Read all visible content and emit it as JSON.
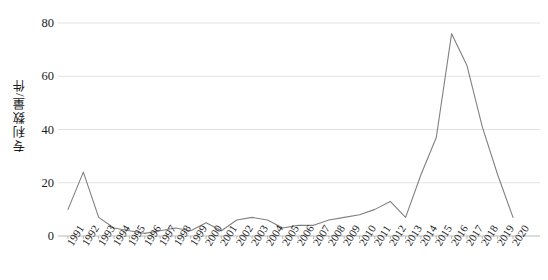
{
  "chart_data": {
    "type": "line",
    "title": "",
    "subtitle": "",
    "xlabel": "",
    "ylabel": "专利数量/件",
    "ylim": [
      0,
      80
    ],
    "yticks": [
      0,
      20,
      40,
      60,
      80
    ],
    "grid": true,
    "legend": "none",
    "line_color": "#808080",
    "categories": [
      "1991",
      "1992",
      "1993",
      "1994",
      "1995",
      "1996",
      "1997",
      "1998",
      "1999",
      "2000",
      "2001",
      "2002",
      "2003",
      "2004",
      "2005",
      "2006",
      "2007",
      "2008",
      "2009",
      "2010",
      "2011",
      "2012",
      "2013",
      "2014",
      "2015",
      "2016",
      "2017",
      "2018",
      "2019",
      "2020"
    ],
    "values": [
      10,
      24,
      7,
      3,
      2,
      1,
      2,
      3,
      2,
      5,
      2,
      6,
      7,
      6,
      3,
      4,
      4,
      6,
      7,
      8,
      10,
      13,
      7,
      23,
      37,
      76,
      64,
      41,
      23,
      7
    ],
    "series": [
      {
        "name": "专利数量",
        "values": [
          10,
          24,
          7,
          3,
          2,
          1,
          2,
          3,
          2,
          5,
          2,
          6,
          7,
          6,
          3,
          4,
          4,
          6,
          7,
          8,
          10,
          13,
          7,
          23,
          37,
          76,
          64,
          41,
          23,
          7
        ]
      }
    ]
  },
  "axes": {
    "y_tick_labels": [
      "80",
      "60",
      "40",
      "20",
      "0"
    ],
    "y_axis_title": "专利数量/件"
  }
}
